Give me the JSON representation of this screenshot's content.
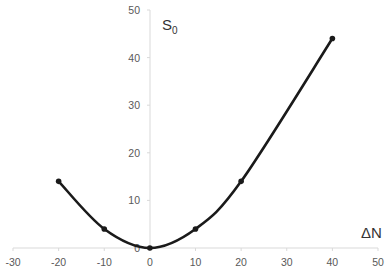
{
  "chart_data": {
    "type": "scatter",
    "title": "",
    "xlabel": "ΔN",
    "ylabel": "S",
    "ylabel_subscript": "0",
    "xlim": [
      -30,
      50
    ],
    "ylim": [
      0,
      50
    ],
    "x_ticks": [
      "-30",
      "-20",
      "-10",
      "0",
      "10",
      "20",
      "30",
      "40",
      "50"
    ],
    "y_ticks": [
      "0",
      "10",
      "20",
      "30",
      "40",
      "50"
    ],
    "grid": false,
    "legend": null,
    "series": [
      {
        "name": "S0",
        "smooth": true,
        "color": "#1a1a1a",
        "points": [
          {
            "x": -20,
            "y": 14
          },
          {
            "x": -10,
            "y": 4
          },
          {
            "x": 0,
            "y": 0
          },
          {
            "x": 10,
            "y": 4
          },
          {
            "x": 20,
            "y": 14
          },
          {
            "x": 40,
            "y": 44
          }
        ]
      }
    ]
  }
}
